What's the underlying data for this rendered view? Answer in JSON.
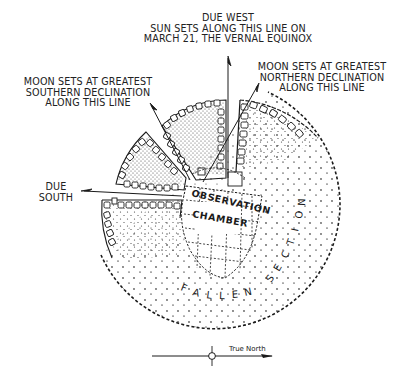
{
  "diagram": {
    "type": "plan-view",
    "labels": {
      "due_west": {
        "lines": [
          "DUE WEST",
          "SUN SETS ALONG THIS LINE ON",
          "MARCH 21, THE VERNAL EQUINOX"
        ]
      },
      "moon_northern": {
        "lines": [
          "MOON SETS AT GREATEST",
          "NORTHERN DECLINATION",
          "ALONG THIS LINE"
        ]
      },
      "moon_southern": {
        "lines": [
          "MOON SETS AT GREATEST",
          "SOUTHERN DECLINATION",
          "ALONG THIS LINE"
        ]
      },
      "due_south": {
        "lines": [
          "DUE",
          "SOUTH"
        ]
      },
      "chamber": {
        "line1": "OBSERVATION",
        "line2": "CHAMBER"
      },
      "fallen_section": {
        "word1": "FALLEN",
        "word2": "SECTION"
      },
      "north_arrow": "True North"
    },
    "colors": {
      "ink": "#1a1a1a",
      "stipple": "#3a3a3a",
      "background": "#ffffff"
    }
  }
}
